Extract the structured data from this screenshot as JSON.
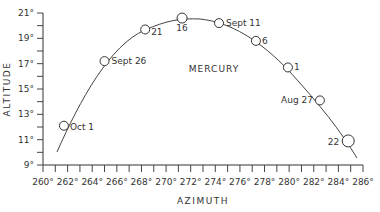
{
  "chart_data": {
    "type": "scatter",
    "title": "MERCURY",
    "xlabel": "AZIMUTH",
    "ylabel": "ALTITUDE",
    "xlim": [
      260,
      286
    ],
    "ylim": [
      9,
      21
    ],
    "grid": false,
    "x_ticks": [
      "260°",
      "262°",
      "264°",
      "266°",
      "268°",
      "270°",
      "272°",
      "274°",
      "276°",
      "278°",
      "280°",
      "282°",
      "284°",
      "286°"
    ],
    "y_ticks": [
      "9°",
      "11°",
      "13°",
      "15°",
      "17°",
      "19°",
      "21°"
    ],
    "series": [
      {
        "name": "Mercury positions",
        "points": [
          {
            "label": "Oct 1",
            "azimuth": 261.7,
            "altitude": 12.1
          },
          {
            "label": "Sept 26",
            "azimuth": 265.0,
            "altitude": 17.2
          },
          {
            "label": "21",
            "azimuth": 268.3,
            "altitude": 19.7
          },
          {
            "label": "16",
            "azimuth": 271.3,
            "altitude": 20.6
          },
          {
            "label": "Sept 11",
            "azimuth": 274.3,
            "altitude": 20.2
          },
          {
            "label": "6",
            "azimuth": 277.3,
            "altitude": 18.8
          },
          {
            "label": "1",
            "azimuth": 279.9,
            "altitude": 16.7
          },
          {
            "label": "Aug 27",
            "azimuth": 282.5,
            "altitude": 14.1
          },
          {
            "label": "22",
            "azimuth": 284.8,
            "altitude": 10.9
          }
        ]
      }
    ]
  }
}
